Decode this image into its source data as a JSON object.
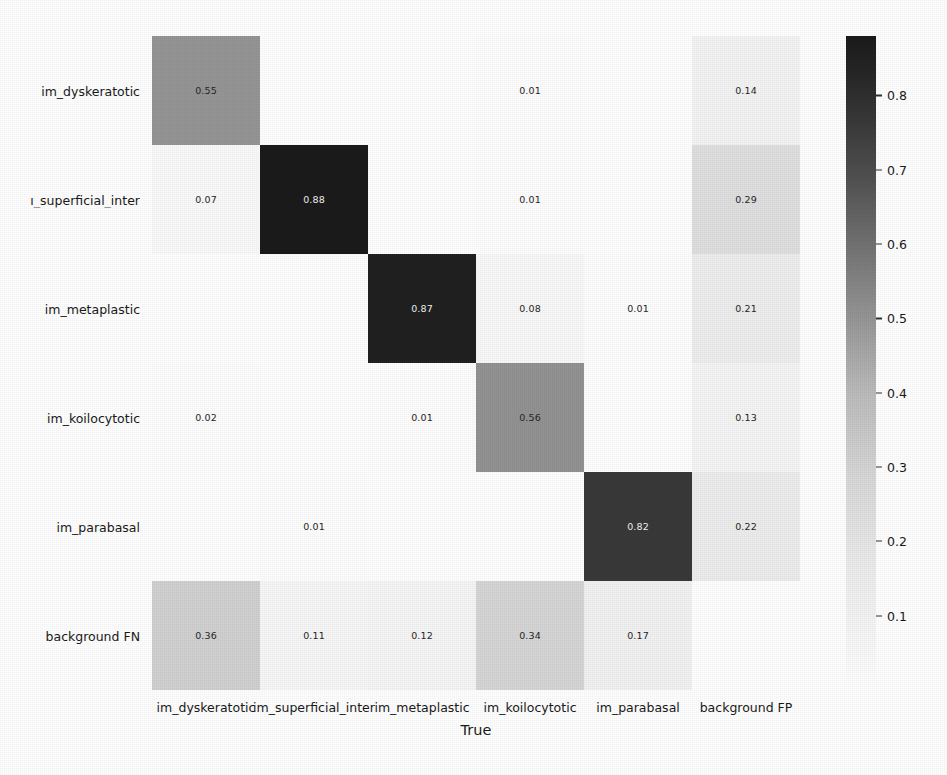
{
  "chart_data": {
    "type": "heatmap",
    "title": "",
    "subtitle": "",
    "xlabel": "True",
    "ylabel": "",
    "grid": false,
    "legend_position": "right",
    "colormap": "Greys",
    "categories_x": [
      "im_dyskeratotic",
      "im_superficial_inter",
      "im_metaplastic",
      "im_koilocytotic",
      "im_parabasal",
      "background FP"
    ],
    "categories_y": [
      "im_dyskeratotic",
      "im_superficial_inter",
      "im_metaplastic",
      "im_koilocytotic",
      "im_parabasal",
      "background FN"
    ],
    "y_tick_display": [
      "im_dyskeratotic",
      "ı_superficial_inter",
      "im_metaplastic",
      "im_koilocytotic",
      "im_parabasal",
      "background FN"
    ],
    "values": [
      [
        0.55,
        null,
        null,
        0.01,
        null,
        0.14
      ],
      [
        0.07,
        0.88,
        null,
        0.01,
        null,
        0.29
      ],
      [
        null,
        null,
        0.87,
        0.08,
        0.01,
        0.21
      ],
      [
        0.02,
        null,
        0.01,
        0.56,
        null,
        0.13
      ],
      [
        null,
        0.01,
        null,
        null,
        0.82,
        0.22
      ],
      [
        0.36,
        0.11,
        0.12,
        0.34,
        0.17,
        null
      ]
    ],
    "cell_text": [
      [
        "0.55",
        "",
        "",
        "0.01",
        "",
        "0.14"
      ],
      [
        "0.07",
        "0.88",
        "",
        "0.01",
        "",
        "0.29"
      ],
      [
        "",
        "",
        "0.87",
        "0.08",
        "0.01",
        "0.21"
      ],
      [
        "0.02",
        "",
        "0.01",
        "0.56",
        "",
        "0.13"
      ],
      [
        "",
        "0.01",
        "",
        "",
        "0.82",
        "0.22"
      ],
      [
        "0.36",
        "0.11",
        "0.12",
        "0.34",
        "0.17",
        ""
      ]
    ],
    "vmin": 0.0,
    "vmax": 0.88,
    "colorbar": {
      "ticks": [
        0.1,
        0.2,
        0.3,
        0.4,
        0.5,
        0.6,
        0.7,
        0.8
      ],
      "tick_labels": [
        "0.1",
        "0.2",
        "0.3",
        "0.4",
        "0.5",
        "0.6",
        "0.7",
        "0.8"
      ]
    }
  },
  "colors": {
    "background": "#ffffff",
    "text": "#1a1a1a",
    "cell_text_light": "#f2f2f2",
    "cell_text_dark": "#262626"
  }
}
